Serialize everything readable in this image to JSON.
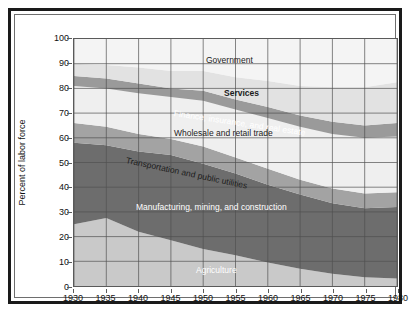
{
  "figure": {
    "frame_style": "double-rule-box",
    "background": "#ffffff"
  },
  "axes": {
    "y_title": "Percent of labor force",
    "y_ticks": [
      0,
      10,
      20,
      30,
      40,
      50,
      60,
      70,
      80,
      90,
      100
    ],
    "x_ticks": [
      1930,
      1935,
      1940,
      1945,
      1950,
      1955,
      1960,
      1965,
      1970,
      1975,
      1980
    ],
    "x_title": ""
  },
  "labels": {
    "government": "Government",
    "services": "Services",
    "finance": "Finance, insurance, and real estate",
    "wholesale": "Wholesale and retail trade",
    "transportation": "Transportation and public utilities",
    "manufacturing": "Manufacturing, mining, and construction",
    "agriculture": "Agriculture"
  },
  "colors": {
    "agriculture": "#c9c9c9",
    "manufacturing": "#6d6d6d",
    "transportation": "#a3a3a3",
    "wholesale": "#efefef",
    "finance": "#9a9a9a",
    "services": "#e2e2e2",
    "government": "#f4f4f4",
    "gridline": "#4f4f4f",
    "axis": "#5a5a5a",
    "text": "#111111",
    "text_light": "#ffffff"
  },
  "chart_data": {
    "type": "area",
    "title": "",
    "subtitle": "",
    "xlabel": "",
    "ylabel": "Percent of labor force",
    "xlim": [
      1930,
      1980
    ],
    "ylim": [
      0,
      100
    ],
    "grid": true,
    "legend": "in-plot band labels",
    "stacked": true,
    "stack_order_bottom_to_top": [
      "Agriculture",
      "Manufacturing, mining, and construction",
      "Transportation and public utilities",
      "Wholesale and retail trade",
      "Finance, insurance, and real estate",
      "Services",
      "Government"
    ],
    "x": [
      1930,
      1935,
      1940,
      1945,
      1950,
      1955,
      1960,
      1965,
      1970,
      1975,
      1980
    ],
    "series": [
      {
        "name": "Agriculture",
        "color": "#c9c9c9",
        "values": [
          25.0,
          27.5,
          22.0,
          18.5,
          15.0,
          12.5,
          9.5,
          7.0,
          5.0,
          3.5,
          3.0
        ]
      },
      {
        "name": "Manufacturing, mining, and construction",
        "color": "#6d6d6d",
        "values": [
          33.0,
          29.5,
          32.5,
          34.5,
          34.5,
          33.0,
          31.5,
          30.0,
          28.5,
          28.0,
          29.0
        ]
      },
      {
        "name": "Transportation and public utilities",
        "color": "#a3a3a3",
        "values": [
          8.0,
          7.5,
          7.0,
          6.5,
          7.0,
          6.5,
          6.5,
          6.0,
          6.0,
          6.0,
          6.0
        ]
      },
      {
        "name": "Wholesale and retail trade",
        "color": "#efefef",
        "values": [
          15.0,
          15.5,
          16.5,
          17.0,
          18.5,
          19.5,
          20.5,
          21.5,
          22.0,
          22.5,
          22.5
        ]
      },
      {
        "name": "Finance, insurance, and real estate",
        "color": "#9a9a9a",
        "values": [
          4.0,
          4.0,
          4.0,
          3.5,
          4.0,
          4.0,
          4.5,
          4.5,
          5.0,
          5.0,
          5.5
        ]
      },
      {
        "name": "Services",
        "color": "#e2e2e2",
        "values": [
          5.0,
          5.5,
          6.5,
          7.0,
          8.0,
          9.0,
          10.5,
          12.0,
          14.0,
          15.5,
          16.5
        ]
      },
      {
        "name": "Government",
        "color": "#f4f4f4",
        "values": [
          10.0,
          10.5,
          11.5,
          13.0,
          13.0,
          15.5,
          17.0,
          19.0,
          19.5,
          19.5,
          17.5
        ]
      }
    ],
    "cumulative_top_boundaries": {
      "agriculture": [
        25.0,
        27.5,
        22.0,
        18.5,
        15.0,
        12.5,
        9.5,
        7.0,
        5.0,
        3.5,
        3.0
      ],
      "manufacturing": [
        58.0,
        57.0,
        54.5,
        53.0,
        49.5,
        45.5,
        41.0,
        37.0,
        33.5,
        31.5,
        32.0
      ],
      "transportation": [
        66.0,
        64.5,
        61.5,
        59.5,
        56.5,
        52.0,
        47.5,
        43.0,
        39.5,
        37.5,
        38.0
      ],
      "wholesale": [
        81.0,
        80.0,
        78.0,
        76.5,
        75.0,
        71.5,
        68.0,
        64.5,
        61.5,
        60.0,
        60.5
      ],
      "finance": [
        85.0,
        84.0,
        82.0,
        80.0,
        79.0,
        75.5,
        72.5,
        69.0,
        66.5,
        65.0,
        66.0
      ],
      "services": [
        90.0,
        89.5,
        88.5,
        87.0,
        87.0,
        84.5,
        83.0,
        81.0,
        80.5,
        80.5,
        82.5
      ],
      "government": [
        100.0,
        100.0,
        100.0,
        100.0,
        100.0,
        100.0,
        100.0,
        100.0,
        100.0,
        100.0,
        100.0
      ]
    }
  }
}
